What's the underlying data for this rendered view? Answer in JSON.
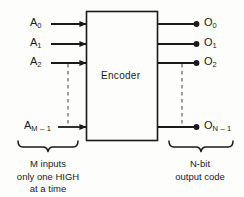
{
  "diagram": {
    "block": {
      "label": "Encoder"
    },
    "inputs": [
      {
        "name": "A",
        "sub": "0"
      },
      {
        "name": "A",
        "sub": "1"
      },
      {
        "name": "A",
        "sub": "2"
      },
      {
        "name": "A",
        "sub": "M – 1"
      }
    ],
    "outputs": [
      {
        "name": "O",
        "sub": "0"
      },
      {
        "name": "O",
        "sub": "1"
      },
      {
        "name": "O",
        "sub": "2"
      },
      {
        "name": "O",
        "sub": "N – 1"
      }
    ],
    "captions": {
      "left": [
        "M inputs",
        "only one HIGH",
        "at a time"
      ],
      "right": [
        "N-bit",
        "output code"
      ]
    },
    "colors": {
      "ink": "#1a1a1a",
      "background": "#fdfdfb",
      "dashed": "#6b6b6b"
    }
  }
}
